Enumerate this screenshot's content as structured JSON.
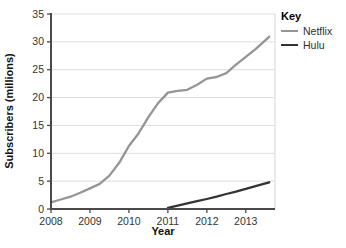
{
  "legend": {
    "title": "Key"
  },
  "colors": {
    "grid": "#dedede",
    "plot_border": "#d6d6d6",
    "axis": "#4a4a4a",
    "tick_text": "#333333",
    "label_text": "#111111",
    "background": "#ffffff",
    "netflix": "#949597",
    "hulu": "#333333"
  },
  "chart_data": {
    "type": "line",
    "title": "",
    "xlabel": "Year",
    "ylabel": "Subscribers (millions)",
    "xlim": [
      2008,
      2013.75
    ],
    "ylim": [
      0,
      35
    ],
    "xticks": [
      2008,
      2009,
      2010,
      2011,
      2012,
      2013
    ],
    "yticks": [
      0,
      5,
      10,
      15,
      20,
      25,
      30,
      35
    ],
    "grid": true,
    "legend_position": "right",
    "legend_title": "Key",
    "series": [
      {
        "name": "Netflix",
        "color": "#949597",
        "x": [
          2008,
          2008.25,
          2008.5,
          2008.75,
          2009,
          2009.25,
          2009.5,
          2009.75,
          2010,
          2010.25,
          2010.5,
          2010.75,
          2011,
          2011.25,
          2011.5,
          2011.75,
          2012,
          2012.25,
          2012.5,
          2012.75,
          2013,
          2013.25,
          2013.6
        ],
        "y": [
          1.2,
          1.7,
          2.2,
          2.9,
          3.7,
          4.5,
          6.0,
          8.3,
          11.3,
          13.6,
          16.5,
          19.0,
          20.9,
          21.2,
          21.4,
          22.3,
          23.4,
          23.7,
          24.4,
          25.9,
          27.3,
          28.7,
          30.9
        ]
      },
      {
        "name": "Hulu",
        "color": "#333333",
        "x": [
          2011,
          2011.25,
          2011.5,
          2011.75,
          2012,
          2012.25,
          2012.5,
          2012.75,
          2013,
          2013.25,
          2013.6
        ],
        "y": [
          0.2,
          0.6,
          1.0,
          1.4,
          1.8,
          2.2,
          2.7,
          3.1,
          3.6,
          4.1,
          4.8
        ]
      }
    ]
  }
}
